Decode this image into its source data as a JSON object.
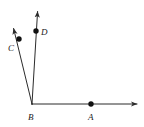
{
  "figure": {
    "background_color": "#ffffff",
    "line_color": "#2b2b2b",
    "label_color": "#1a1a1a",
    "dot_color": "#111111",
    "stroke_width": 1,
    "dot_radius": 2.6,
    "vertex": {
      "name": "B",
      "label": "B",
      "x": 32,
      "y": 104,
      "label_x": 28,
      "label_y": 120
    },
    "points": [
      {
        "name": "A",
        "label": "A",
        "x": 91,
        "y": 104,
        "label_x": 88,
        "label_y": 120
      },
      {
        "name": "C",
        "label": "C",
        "x": 19,
        "y": 39,
        "label_x": 8,
        "label_y": 51
      },
      {
        "name": "D",
        "label": "D",
        "x": 36,
        "y": 31,
        "label_x": 41,
        "label_y": 35
      }
    ],
    "rays": [
      {
        "name": "ray-BA",
        "label": "BA",
        "from_x": 32,
        "from_y": 104,
        "to_x": 139,
        "to_y": 104,
        "arrow": true
      },
      {
        "name": "ray-BC",
        "label": "BC",
        "from_x": 32,
        "from_y": 104,
        "to_x": 13,
        "to_y": 26,
        "arrow": true
      },
      {
        "name": "ray-BD",
        "label": "BD",
        "from_x": 32,
        "from_y": 104,
        "to_x": 38,
        "to_y": 9,
        "arrow": true
      }
    ]
  }
}
